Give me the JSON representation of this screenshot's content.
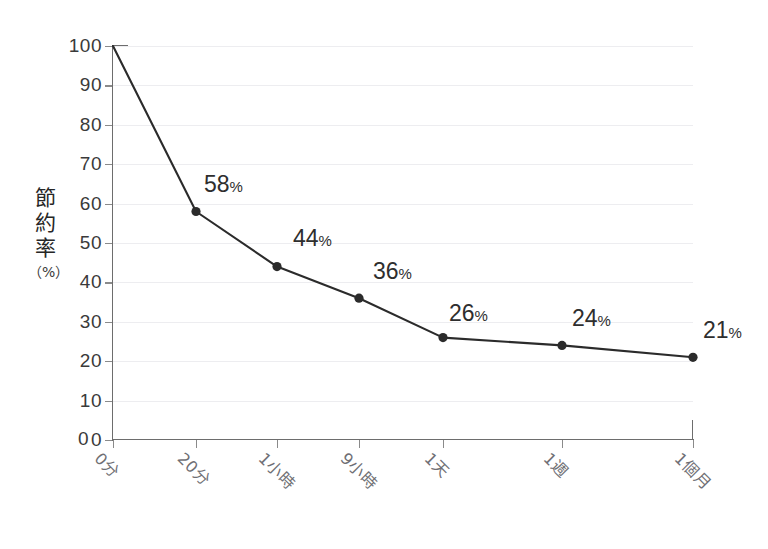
{
  "chart_data": {
    "type": "line",
    "title": "",
    "xlabel": "時間",
    "ylabel": "節約率",
    "ylabel_unit": "（%）",
    "categories": [
      "0分",
      "20分",
      "1小時",
      "9小時",
      "1天",
      "1週",
      "1個月"
    ],
    "values": [
      100,
      58,
      44,
      36,
      26,
      24,
      21
    ],
    "point_labels": [
      "",
      "58",
      "44",
      "36",
      "26",
      "24",
      "21"
    ],
    "point_label_suffix": "%",
    "ylim": [
      0,
      100
    ],
    "ytick_labels": [
      "100",
      "90",
      "80",
      "70",
      "60",
      "50",
      "40",
      "30",
      "20",
      "10",
      "0"
    ],
    "ytick_values": [
      100,
      90,
      80,
      70,
      60,
      50,
      40,
      30,
      20,
      10,
      0
    ],
    "grid": true,
    "legend": "none",
    "series_color": "#2b2b2b",
    "grid_color": "#ededf0",
    "axis_color": "#6d6d6d",
    "xtick_label_color": "#6f6f74"
  }
}
